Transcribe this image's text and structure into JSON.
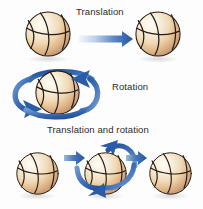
{
  "figure": {
    "title_row1": "Translation",
    "title_row2": "Rotation",
    "title_row3": "Translation and rotation",
    "background_color": "#fdfdfd",
    "width": 203,
    "height": 209
  },
  "colors": {
    "ball_highlight": "#fdf6ea",
    "ball_mid": "#f0dcbe",
    "ball_tan": "#e3b782",
    "ball_edge": "#c9843f",
    "seam": "#2a2018",
    "arrow_blue": "#2a5ca8",
    "arrow_blue_light": "#eaf1fa",
    "arrow_blue_mid": "#5b86c4",
    "text": "#2b2b2b",
    "shadow": "#cfcfcf"
  },
  "rows": [
    {
      "id": "translation",
      "label": "Translation",
      "balls": [
        {
          "name": "ball-source",
          "cx": 48,
          "cy": 34,
          "r": 24
        },
        {
          "name": "ball-target",
          "cx": 158,
          "cy": 34,
          "r": 24
        }
      ],
      "arrows": [
        {
          "name": "translation-arrow",
          "type": "straight",
          "x1": 80,
          "y1": 39,
          "x2": 131,
          "y2": 39
        }
      ]
    },
    {
      "id": "rotation",
      "label": "Rotation",
      "balls": [
        {
          "name": "ball-rotating",
          "cx": 57,
          "cy": 92,
          "r": 24
        }
      ],
      "arrows": [
        {
          "name": "rotation-orbit-arrow",
          "type": "orbit",
          "cx": 57,
          "cy": 95,
          "rx": 40,
          "ry": 17
        }
      ]
    },
    {
      "id": "translation-and-rotation",
      "label": "Translation and rotation",
      "balls": [
        {
          "name": "ball-start",
          "cx": 37,
          "cy": 173,
          "r": 23
        },
        {
          "name": "ball-middle",
          "cx": 105,
          "cy": 173,
          "r": 23
        },
        {
          "name": "ball-end",
          "cx": 168,
          "cy": 173,
          "r": 23
        }
      ],
      "arrows": [
        {
          "name": "translation-arrow-1",
          "type": "straight",
          "x1": 66,
          "y1": 158,
          "x2": 84,
          "y2": 158
        },
        {
          "name": "translation-arrow-2",
          "type": "straight",
          "x1": 128,
          "y1": 158,
          "x2": 146,
          "y2": 158
        },
        {
          "name": "rotation-orbit-arrow-middle",
          "type": "orbit",
          "cx": 105,
          "cy": 173,
          "rx": 36,
          "ry": 30
        }
      ]
    }
  ]
}
